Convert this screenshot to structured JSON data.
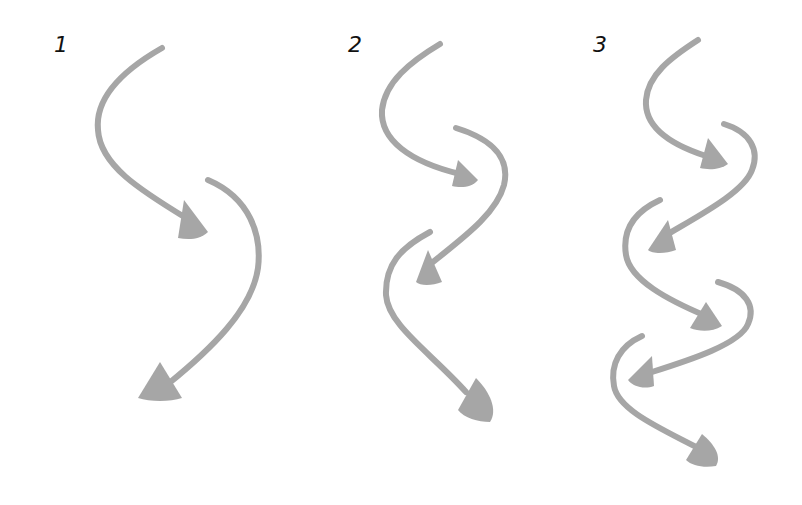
{
  "colors": {
    "arrow": "#a6a6a6",
    "label": "#111111",
    "background": "#ffffff"
  },
  "panels": [
    {
      "label": "1",
      "arrow_count": 2
    },
    {
      "label": "2",
      "arrow_count": 3
    },
    {
      "label": "3",
      "arrow_count": 5
    }
  ]
}
